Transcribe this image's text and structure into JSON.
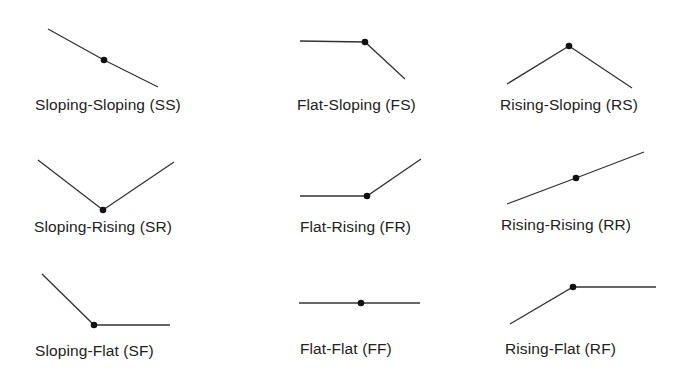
{
  "colors": {
    "line": "#333333",
    "point": "#111111",
    "text": "#222222",
    "background": "#ffffff"
  },
  "patterns": [
    {
      "id": "SS",
      "label": "Sloping-Sloping (SS)",
      "segment1": "Sloping",
      "segment2": "Sloping",
      "points": [
        [
          48,
          29
        ],
        [
          104,
          60
        ],
        [
          158,
          87
        ]
      ],
      "label_pos": [
        35,
        96
      ]
    },
    {
      "id": "FS",
      "label": "Flat-Sloping (FS)",
      "segment1": "Flat",
      "segment2": "Sloping",
      "points": [
        [
          300,
          41
        ],
        [
          365,
          42
        ],
        [
          405,
          79
        ]
      ],
      "label_pos": [
        297,
        96
      ]
    },
    {
      "id": "RS",
      "label": "Rising-Sloping (RS)",
      "segment1": "Rising",
      "segment2": "Sloping",
      "points": [
        [
          507,
          84
        ],
        [
          569,
          46
        ],
        [
          632,
          88
        ]
      ],
      "label_pos": [
        500,
        96
      ]
    },
    {
      "id": "SR",
      "label": "Sloping-Rising (SR)",
      "segment1": "Sloping",
      "segment2": "Rising",
      "points": [
        [
          38,
          160
        ],
        [
          103,
          210
        ],
        [
          174,
          162
        ]
      ],
      "label_pos": [
        34,
        218
      ]
    },
    {
      "id": "FR",
      "label": "Flat-Rising (FR)",
      "segment1": "Flat",
      "segment2": "Rising",
      "points": [
        [
          300,
          196
        ],
        [
          367,
          196
        ],
        [
          421,
          159
        ]
      ],
      "label_pos": [
        300,
        218
      ]
    },
    {
      "id": "RR",
      "label": "Rising-Rising (RR)",
      "segment1": "Rising",
      "segment2": "Rising",
      "points": [
        [
          507,
          204
        ],
        [
          576,
          178
        ],
        [
          644,
          152
        ]
      ],
      "label_pos": [
        501,
        216
      ]
    },
    {
      "id": "SF",
      "label": "Sloping-Flat (SF)",
      "segment1": "Sloping",
      "segment2": "Flat",
      "points": [
        [
          42,
          274
        ],
        [
          94,
          325
        ],
        [
          170,
          325
        ]
      ],
      "label_pos": [
        35,
        342
      ]
    },
    {
      "id": "FF",
      "label": "Flat-Flat (FF)",
      "segment1": "Flat",
      "segment2": "Flat",
      "points": [
        [
          299,
          303
        ],
        [
          361,
          303
        ],
        [
          420,
          303
        ]
      ],
      "label_pos": [
        300,
        340
      ]
    },
    {
      "id": "RF",
      "label": "Rising-Flat (RF)",
      "segment1": "Rising",
      "segment2": "Flat",
      "points": [
        [
          510,
          324
        ],
        [
          573,
          287
        ],
        [
          656,
          287
        ]
      ],
      "label_pos": [
        505,
        340
      ]
    }
  ]
}
